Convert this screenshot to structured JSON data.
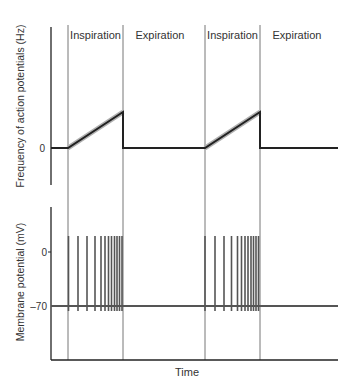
{
  "phases": [
    {
      "label": "Inspiration",
      "x0": 68,
      "x1": 123
    },
    {
      "label": "Expiration",
      "x0": 123,
      "x1": 205
    },
    {
      "label": "Inspiration",
      "x0": 205,
      "x1": 260
    },
    {
      "label": "Expiration",
      "x0": 260,
      "x1": 338
    }
  ],
  "top_panel": {
    "ylabel": "Frequency of action potentials (Hz)",
    "tick_label": "0"
  },
  "bottom_panel": {
    "ylabel": "Membrane potential (mV)",
    "tick_labels": [
      "0",
      "–70"
    ]
  },
  "xlabel": "Time",
  "colors": {
    "axis": "#222222",
    "divider": "#777777",
    "trace": "#222222",
    "trace_halo": "#b0b0b0",
    "spike": "#555555"
  }
}
